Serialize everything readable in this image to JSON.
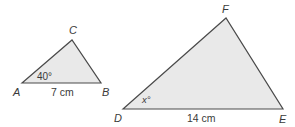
{
  "figure": {
    "colors": {
      "fill": "#e9e9e9",
      "stroke": "#4a4a4a",
      "text": "#3a3a3a"
    },
    "triangle_abc": {
      "vertices": {
        "A": "A",
        "B": "B",
        "C": "C"
      },
      "angle_A": "40°",
      "side_AB": "7 cm"
    },
    "triangle_def": {
      "vertices": {
        "D": "D",
        "E": "E",
        "F": "F"
      },
      "angle_D": "x°",
      "side_DE": "14 cm"
    }
  }
}
